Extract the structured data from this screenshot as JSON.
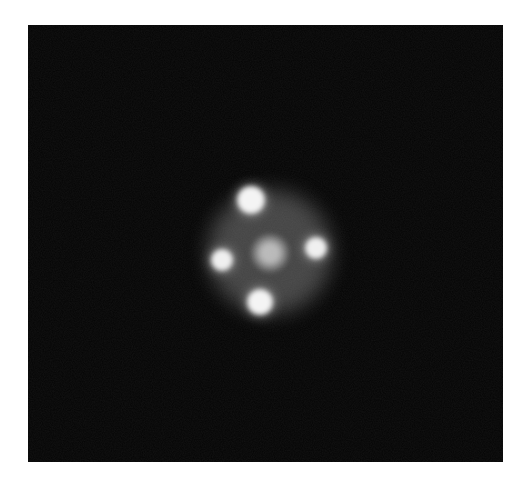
{
  "image": {
    "subject": "quadruply lensed point source (cross pattern) with central diffuse core",
    "background_color": "#040404",
    "border_color": "#ffffff",
    "frame": {
      "x": 28,
      "y": 25,
      "width": 475,
      "height": 437
    },
    "halo": {
      "cx": 270,
      "cy": 252,
      "rx": 62,
      "ry": 62,
      "color": "rgba(190,190,190,0.35)"
    },
    "core": {
      "cx": 270,
      "cy": 253,
      "r": 20,
      "color": "rgba(225,225,225,0.75)"
    },
    "spots": [
      {
        "name": "top",
        "cx": 251,
        "cy": 200,
        "r": 14,
        "color": "#f4f4f4"
      },
      {
        "name": "left",
        "cx": 222,
        "cy": 260,
        "r": 11,
        "color": "#f0f0f0"
      },
      {
        "name": "right",
        "cx": 316,
        "cy": 248,
        "r": 11,
        "color": "#f0f0f0"
      },
      {
        "name": "bottom",
        "cx": 260,
        "cy": 302,
        "r": 13,
        "color": "#f4f4f4"
      }
    ]
  }
}
